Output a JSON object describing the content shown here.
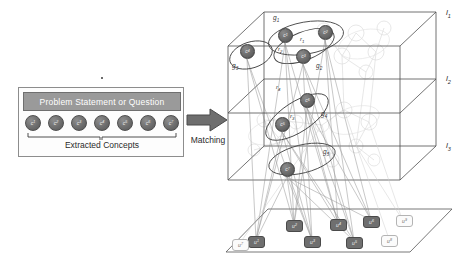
{
  "figure": {
    "caption": "",
    "left_panel": {
      "header": "Problem Statement or Question",
      "concepts_caption": "Extracted Concepts",
      "concepts": [
        {
          "id": "c1",
          "base": "c",
          "sub": "1"
        },
        {
          "id": "c2",
          "base": "c",
          "sub": "2"
        },
        {
          "id": "c3",
          "base": "c",
          "sub": "3"
        },
        {
          "id": "c4",
          "base": "c",
          "sub": "4"
        },
        {
          "id": "c5",
          "base": "c",
          "sub": "5"
        },
        {
          "id": "c6",
          "base": "c",
          "sub": "6"
        },
        {
          "id": "c7",
          "base": "c",
          "sub": "7"
        }
      ]
    },
    "transition": {
      "label": "Matching",
      "icon": "right-arrow-icon"
    },
    "network": {
      "layers": [
        {
          "id": "l1",
          "base": "l",
          "sub": "1"
        },
        {
          "id": "l2",
          "base": "l",
          "sub": "2"
        },
        {
          "id": "l3",
          "base": "l",
          "sub": "3"
        }
      ],
      "concept_nodes": [
        {
          "id": "c1",
          "base": "c",
          "sub": "1",
          "layer": "l1",
          "x": 54,
          "y": 28
        },
        {
          "id": "c2",
          "base": "c",
          "sub": "2",
          "layer": "l1",
          "x": 94,
          "y": 25
        },
        {
          "id": "c3",
          "base": "c",
          "sub": "3",
          "layer": "l1",
          "x": 72,
          "y": 49
        },
        {
          "id": "c4",
          "base": "c",
          "sub": "4",
          "layer": "l1",
          "x": 16,
          "y": 44
        },
        {
          "id": "c5",
          "base": "c",
          "sub": "5",
          "layer": "l2",
          "x": 51,
          "y": 117
        },
        {
          "id": "c6",
          "base": "c",
          "sub": "6",
          "layer": "l2",
          "x": 76,
          "y": 93
        },
        {
          "id": "c7",
          "base": "c",
          "sub": "7",
          "layer": "l3",
          "x": 56,
          "y": 162
        }
      ],
      "groups": [
        {
          "id": "g1",
          "base": "g",
          "sub": "1",
          "members": [
            "c1",
            "c2",
            "c3"
          ],
          "x": 49,
          "y": 14
        },
        {
          "id": "g2",
          "base": "g",
          "sub": "2",
          "members": [
            "c3"
          ],
          "x": 92,
          "y": 62
        },
        {
          "id": "g3",
          "base": "g",
          "sub": "3",
          "members": [
            "c4"
          ],
          "x": 8,
          "y": 62
        },
        {
          "id": "g4",
          "base": "g",
          "sub": "4",
          "members": [
            "c5",
            "c6"
          ],
          "x": 97,
          "y": 110
        },
        {
          "id": "g5",
          "base": "g",
          "sub": "5",
          "members": [
            "c7"
          ],
          "x": 99,
          "y": 148
        }
      ],
      "relations": [
        {
          "id": "r1",
          "base": "r",
          "sub": "1",
          "from": "c1",
          "to": "c2",
          "x": 76,
          "y": 36
        },
        {
          "id": "r2",
          "base": "r",
          "sub": "2",
          "from": "c1",
          "to": "c3",
          "x": 54,
          "y": 46
        },
        {
          "id": "r3",
          "base": "r",
          "sub": "3",
          "from": "c5",
          "to": "c6",
          "x": 66,
          "y": 113
        },
        {
          "id": "r4",
          "base": "r",
          "sub": "4",
          "from": "c3",
          "to": "c6",
          "x": 52,
          "y": 84
        }
      ],
      "user_nodes": [
        {
          "id": "u1",
          "base": "u",
          "sub": "1",
          "state": "selected",
          "x": 24,
          "y": 236
        },
        {
          "id": "u2",
          "base": "u",
          "sub": "2",
          "state": "selected",
          "x": 62,
          "y": 220
        },
        {
          "id": "u3",
          "base": "u",
          "sub": "3",
          "state": "selected",
          "x": 80,
          "y": 236
        },
        {
          "id": "u4",
          "base": "u",
          "sub": "4",
          "state": "selected",
          "x": 106,
          "y": 219
        },
        {
          "id": "u5",
          "base": "u",
          "sub": "5",
          "state": "selected",
          "x": 122,
          "y": 237
        },
        {
          "id": "u6",
          "base": "u",
          "sub": "6",
          "state": "selected",
          "x": 139,
          "y": 216
        },
        {
          "id": "u7",
          "base": "u",
          "sub": "7",
          "state": "unselected",
          "x": 8,
          "y": 239
        },
        {
          "id": "u8",
          "base": "u",
          "sub": "8",
          "state": "unselected",
          "x": 157,
          "y": 235
        },
        {
          "id": "u9",
          "base": "u",
          "sub": "9",
          "state": "unselected",
          "x": 172,
          "y": 215
        }
      ]
    },
    "colors": {
      "header_bar": "#9a9a9a",
      "node_fill": "#6a6a6a",
      "user_selected": "#6f6f6f",
      "user_unselected": "#fbfbfb",
      "outline": "#4a4a4a",
      "faded_network": "#d9d9d9"
    }
  }
}
